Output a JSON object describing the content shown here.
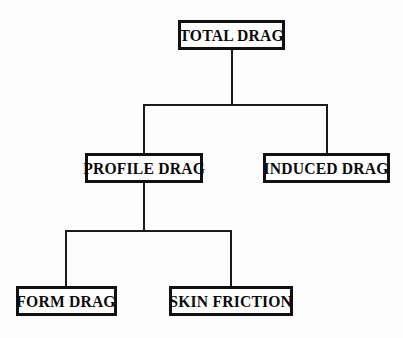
{
  "diagram": {
    "type": "hierarchy-tree",
    "background_color": "#fdfdfd",
    "node_border_color": "#111111",
    "connector_color": "#1a1a1a",
    "nodes": [
      {
        "id": "total",
        "label": "TOTAL DRAG",
        "level": 0
      },
      {
        "id": "profile",
        "label": "PROFILE DRAG",
        "level": 1
      },
      {
        "id": "induced",
        "label": "INDUCED DRAG",
        "level": 1
      },
      {
        "id": "form",
        "label": "FORM DRAG",
        "level": 2
      },
      {
        "id": "skin",
        "label": "SKIN FRICTION",
        "level": 2
      }
    ],
    "edges": [
      {
        "from": "total",
        "to": "profile"
      },
      {
        "from": "total",
        "to": "induced"
      },
      {
        "from": "profile",
        "to": "form"
      },
      {
        "from": "profile",
        "to": "skin"
      }
    ]
  }
}
